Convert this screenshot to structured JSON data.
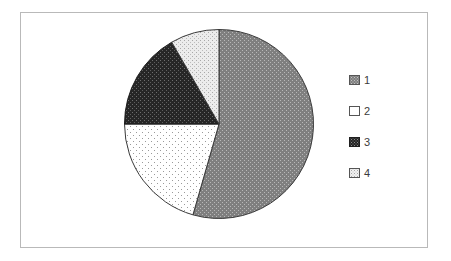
{
  "chart_data": {
    "type": "pie",
    "title": "",
    "subtitle": "",
    "xlabel": "",
    "ylabel": "",
    "grid": false,
    "legend_position": "right",
    "categories": [
      "1",
      "2",
      "3",
      "4"
    ],
    "values": [
      54,
      21,
      17,
      8
    ],
    "units": "percent",
    "start_angle_deg": 0,
    "direction": "clockwise",
    "slices": [
      {
        "label": "1",
        "value": 54,
        "start_angle_deg": 0,
        "end_angle_deg": 196,
        "fill_style": "dotted",
        "fill_color": "#7f7f7f",
        "dot_color": "#b4b4b4",
        "stroke_color": "#3a3a3a"
      },
      {
        "label": "2",
        "value": 21,
        "start_angle_deg": 196,
        "end_angle_deg": 270,
        "fill_style": "sparse-dotted",
        "fill_color": "#ffffff",
        "dot_color": "#9a9a9a",
        "stroke_color": "#3a3a3a"
      },
      {
        "label": "3",
        "value": 17,
        "start_angle_deg": 270,
        "end_angle_deg": 330,
        "fill_style": "dark-dotted",
        "fill_color": "#262626",
        "dot_color": "#6e6e6e",
        "stroke_color": "#1a1a1a"
      },
      {
        "label": "4",
        "value": 8,
        "start_angle_deg": 330,
        "end_angle_deg": 360,
        "fill_style": "light-dotted",
        "fill_color": "#ebebeb",
        "dot_color": "#a8a8a8",
        "stroke_color": "#3a3a3a"
      }
    ]
  },
  "legend": {
    "items": [
      {
        "label": "1",
        "swatch_name": "legend-swatch-gray-dotted"
      },
      {
        "label": "2",
        "swatch_name": "legend-swatch-white"
      },
      {
        "label": "3",
        "swatch_name": "legend-swatch-dark-dotted"
      },
      {
        "label": "4",
        "swatch_name": "legend-swatch-light-dotted"
      }
    ]
  },
  "colors": {
    "frame_border": "#b9b9b9",
    "background": "#ffffff",
    "text": "#3b3b3b"
  }
}
